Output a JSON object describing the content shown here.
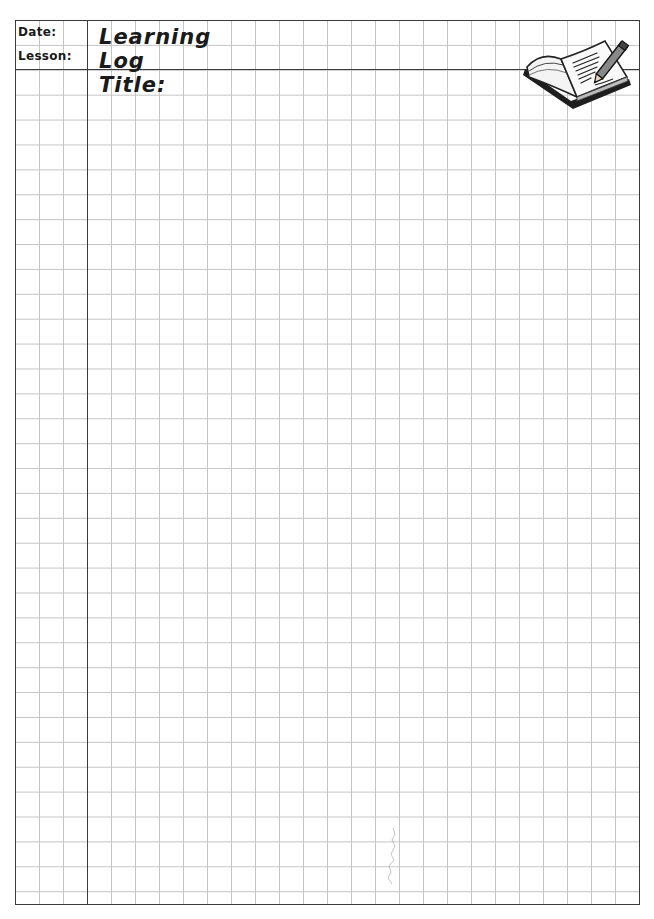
{
  "worksheet": {
    "type": "Learning Log grid page",
    "header": {
      "date_label": "Date:",
      "lesson_label": "Lesson:",
      "title_label": "Learning Log Title:"
    },
    "icons": {
      "header_illustration": "open-book-with-pencil"
    },
    "grid": {
      "columns": 26,
      "rows": 36,
      "line_color": "#c4c4c4",
      "border_color": "#3a3a3a"
    }
  }
}
